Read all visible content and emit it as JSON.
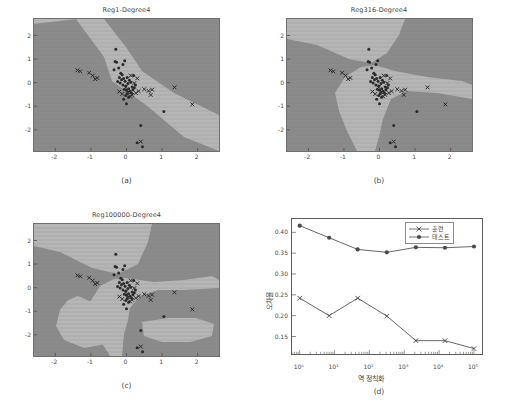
{
  "figure": {
    "background": "#ffffff",
    "region_dark": "#8b8b8b",
    "region_light": "#b6b6b6",
    "marker_color": "#2b2b2b",
    "line_color": "#555555",
    "footer_text": ""
  },
  "panels": [
    {
      "id": "a",
      "caption": "(a)",
      "title": "Reg1-Degree4",
      "xticks": [
        "-2",
        "-1",
        "0",
        "1",
        "2"
      ],
      "yticks": [
        "2",
        "1",
        "0",
        "-1",
        "-2"
      ],
      "xlim": [
        -2.6,
        2.6
      ],
      "ylim": [
        -2.9,
        2.7
      ]
    },
    {
      "id": "b",
      "caption": "(b)",
      "title": "Reg316-Degree4",
      "xticks": [
        "-2",
        "-1",
        "0",
        "1",
        "2"
      ],
      "yticks": [
        "2",
        "1",
        "0",
        "-1",
        "-2"
      ],
      "xlim": [
        -2.6,
        2.6
      ],
      "ylim": [
        -2.9,
        2.7
      ]
    },
    {
      "id": "c",
      "caption": "(c)",
      "title": "Reg100000-Degree4",
      "xticks": [
        "-2",
        "-1",
        "0",
        "1",
        "2"
      ],
      "yticks": [
        "2",
        "1",
        "0",
        "-1",
        "-2"
      ],
      "xlim": [
        -2.6,
        2.6
      ],
      "ylim": [
        -2.9,
        2.7
      ]
    },
    {
      "id": "d",
      "caption": "(d)",
      "title": ""
    }
  ],
  "scatter_points": {
    "circles": [
      [
        -0.3,
        1.42
      ],
      [
        -0.32,
        0.9
      ],
      [
        -0.28,
        0.86
      ],
      [
        -0.22,
        0.62
      ],
      [
        -0.1,
        0.77
      ],
      [
        -0.05,
        0.93
      ],
      [
        -0.16,
        0.4
      ],
      [
        -0.12,
        0.33
      ],
      [
        -0.2,
        0.22
      ],
      [
        -0.14,
        0.12
      ],
      [
        -0.08,
        0.18
      ],
      [
        -0.04,
        0.06
      ],
      [
        -0.18,
        -0.02
      ],
      [
        -0.1,
        -0.1
      ],
      [
        -0.02,
        -0.14
      ],
      [
        0.04,
        -0.04
      ],
      [
        0.08,
        0.1
      ],
      [
        0.02,
        0.22
      ],
      [
        0.12,
        0.02
      ],
      [
        0.16,
        -0.18
      ],
      [
        0.06,
        -0.26
      ],
      [
        0.0,
        -0.32
      ],
      [
        -0.06,
        -0.28
      ],
      [
        0.1,
        -0.36
      ],
      [
        0.18,
        -0.3
      ],
      [
        0.22,
        -0.22
      ],
      [
        0.14,
        -0.44
      ],
      [
        0.02,
        -0.46
      ],
      [
        -0.02,
        -0.55
      ],
      [
        0.06,
        -0.62
      ],
      [
        -0.08,
        -0.7
      ],
      [
        0.0,
        -0.9
      ],
      [
        0.4,
        -1.82
      ],
      [
        1.05,
        -1.22
      ],
      [
        0.3,
        -2.55
      ],
      [
        0.45,
        -2.72
      ],
      [
        -0.35,
        0.55
      ],
      [
        0.2,
        0.3
      ],
      [
        -0.25,
        0.05
      ],
      [
        0.25,
        -0.1
      ]
    ],
    "crosses": [
      [
        -1.38,
        0.52
      ],
      [
        -1.3,
        0.48
      ],
      [
        -1.05,
        0.42
      ],
      [
        -0.95,
        0.3
      ],
      [
        -0.88,
        0.15
      ],
      [
        -0.82,
        0.2
      ],
      [
        0.12,
        0.3
      ],
      [
        0.3,
        0.18
      ],
      [
        0.5,
        -0.28
      ],
      [
        0.62,
        -0.35
      ],
      [
        0.68,
        -0.52
      ],
      [
        0.72,
        -0.3
      ],
      [
        1.35,
        -0.2
      ],
      [
        1.85,
        -0.92
      ],
      [
        -0.2,
        -0.38
      ],
      [
        0.04,
        -0.4
      ],
      [
        0.16,
        -0.52
      ],
      [
        0.26,
        -0.44
      ],
      [
        -0.12,
        -0.48
      ],
      [
        0.34,
        -0.36
      ],
      [
        0.4,
        -2.5
      ],
      [
        0.22,
        -0.02
      ],
      [
        -0.02,
        -0.2
      ],
      [
        0.1,
        -0.58
      ]
    ]
  },
  "chart_data": {
    "type": "line",
    "title": "",
    "xlabel": "역 정칙화",
    "ylabel": "오차율",
    "xscale": "log",
    "x": [
      1,
      7,
      46,
      316,
      2154,
      14700,
      100000
    ],
    "xticklabels": [
      "10⁰",
      "10¹",
      "10²",
      "10³",
      "10⁴",
      "10⁵"
    ],
    "xtick_values": [
      1,
      10,
      100,
      1000,
      10000,
      100000
    ],
    "yticklabels": [
      "0.15",
      "0.20",
      "0.25",
      "0.30",
      "0.35",
      "0.40"
    ],
    "ytick_values": [
      0.15,
      0.2,
      0.25,
      0.3,
      0.35,
      0.4
    ],
    "ylim": [
      0.108,
      0.432
    ],
    "xlim": [
      0.6,
      170000
    ],
    "grid": false,
    "legend_position": "upper right",
    "series": [
      {
        "name": "훈련",
        "marker": "x",
        "values": [
          0.242,
          0.2,
          0.242,
          0.199,
          0.14,
          0.14,
          0.121
        ]
      },
      {
        "name": "테스트",
        "marker": "o",
        "values": [
          0.416,
          0.387,
          0.359,
          0.352,
          0.364,
          0.363,
          0.366
        ]
      }
    ]
  }
}
